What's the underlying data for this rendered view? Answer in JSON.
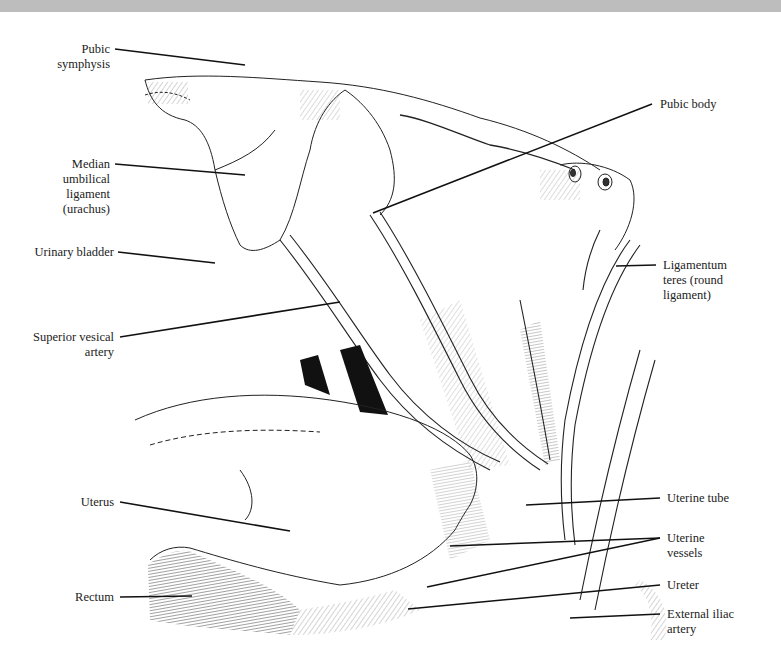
{
  "figure": {
    "type": "anatomical-illustration",
    "colors": {
      "ink": "#1a1a1a",
      "background": "#ffffff",
      "top_band": "#bdbdbd"
    }
  },
  "labels": {
    "pubic_symphysis": "Pubic\nsymphysis",
    "median_umbilical_ligament": "Median\numbilical\nligament\n(urachus)",
    "urinary_bladder": "Urinary bladder",
    "superior_vesical_artery": "Superior vesical\nartery",
    "uterus": "Uterus",
    "rectum": "Rectum",
    "pubic_body": "Pubic body",
    "ligamentum_teres": "Ligamentum\nteres (round\nligament)",
    "uterine_tube": "Uterine tube",
    "uterine_vessels": "Uterine\nvessels",
    "ureter": "Ureter",
    "external_iliac_artery": "External iliac\nartery"
  }
}
